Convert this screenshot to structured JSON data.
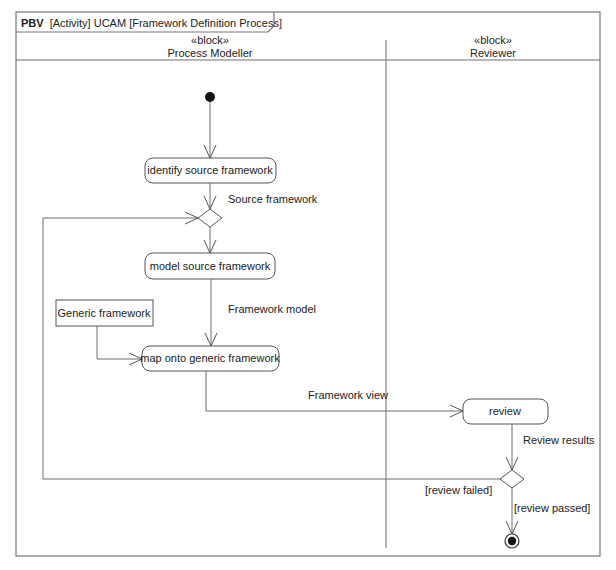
{
  "frame": {
    "kind": "PBV",
    "title": "[Activity] UCAM [Framework Definition Process]"
  },
  "swimlanes": [
    {
      "stereotype": "«block»",
      "name": "Process Modeller"
    },
    {
      "stereotype": "«block»",
      "name": "Reviewer"
    }
  ],
  "actions": {
    "identify": "identify source framework",
    "model": "model source framework",
    "map": "map onto generic framework",
    "review": "review"
  },
  "objects": {
    "generic": "Generic framework"
  },
  "flow_labels": {
    "source_framework": "Source framework",
    "framework_model": "Framework model",
    "framework_view": "Framework view",
    "review_results": "Review results"
  },
  "guards": {
    "failed": "[review failed]",
    "passed": "[review passed]"
  }
}
